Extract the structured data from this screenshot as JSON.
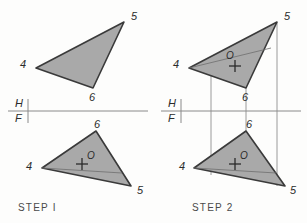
{
  "drawing": {
    "title_type": "orthographic-projection",
    "background_color": "#fdfdfc",
    "line_color": "#3a3a3a",
    "fill_color": "#a9a9a9",
    "projection_line_color": "#9a9a9a",
    "fold_line_color": "#8a8a8a",
    "label_color": "#2b2b2b"
  },
  "fold_line": {
    "upper_label": "H",
    "lower_label": "F"
  },
  "steps": [
    {
      "caption": "STEP I",
      "top_view": {
        "vertices": [
          {
            "label": "4"
          },
          {
            "label": "5"
          },
          {
            "label": "6"
          }
        ],
        "point_label": null
      },
      "front_view": {
        "vertices": [
          {
            "label": "4"
          },
          {
            "label": "5"
          },
          {
            "label": "6"
          }
        ],
        "point_label": "O"
      }
    },
    {
      "caption": "STEP 2",
      "top_view": {
        "vertices": [
          {
            "label": "4"
          },
          {
            "label": "5"
          },
          {
            "label": "6"
          }
        ],
        "point_label": "O"
      },
      "front_view": {
        "vertices": [
          {
            "label": "4"
          },
          {
            "label": "5"
          },
          {
            "label": "6"
          }
        ],
        "point_label": "O"
      }
    }
  ],
  "labels": {
    "s1_top_4": "4",
    "s1_top_5": "5",
    "s1_top_6": "6",
    "s1_fold_h": "H",
    "s1_fold_f": "F",
    "s1_front_4": "4",
    "s1_front_5": "5",
    "s1_front_6": "6",
    "s1_front_o": "O",
    "s1_caption": "STEP I",
    "s2_top_4": "4",
    "s2_top_5": "5",
    "s2_top_6": "6",
    "s2_top_o": "O",
    "s2_fold_h": "H",
    "s2_fold_f": "F",
    "s2_front_4": "4",
    "s2_front_5": "5",
    "s2_front_6": "6",
    "s2_front_o": "O",
    "s2_caption": "STEP 2"
  }
}
